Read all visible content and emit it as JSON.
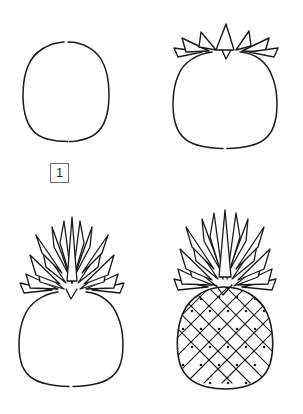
{
  "sheet": {
    "title": "How to Draw a Pineapple",
    "background_color": "#ffffff",
    "ink_color": "#1a1a1a",
    "box_border_color": "#6e6e6e",
    "width": 303,
    "height": 414,
    "columns": 2,
    "rows": 2
  },
  "steps": [
    {
      "number": "1",
      "label": "1",
      "description": "Draw the oval body outline of the pineapple with small gaps at the top and bottom center.",
      "drawing_name": "pineapple-body-oval"
    },
    {
      "number": "2",
      "label": "2",
      "description": "Add a row of short spiky leaves across the top of the oval body.",
      "drawing_name": "pineapple-with-short-crown"
    },
    {
      "number": "3",
      "label": "3",
      "description": "Build up the crown with tall layered pointed leaves above the body.",
      "drawing_name": "pineapple-with-full-crown"
    },
    {
      "number": "4",
      "label": "4",
      "description": "Fill the body with a diamond lattice texture and add a dot in each segment.",
      "drawing_name": "pineapple-finished-with-texture"
    }
  ]
}
